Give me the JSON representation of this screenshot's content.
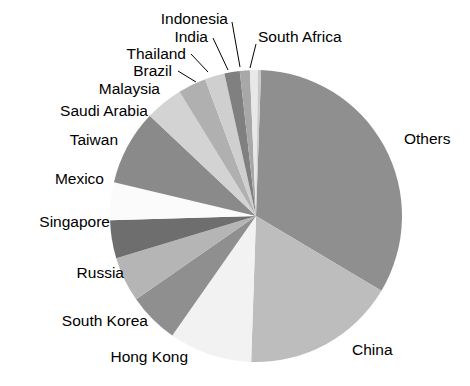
{
  "chart_data": {
    "type": "pie",
    "title": "",
    "subtitle": "",
    "xlabel": "",
    "ylabel": "",
    "legend_position": "none",
    "grid": false,
    "labels_outside": true,
    "categories": [
      "Others",
      "China",
      "Hong Kong",
      "South Korea",
      "Russia",
      "Singapore",
      "Mexico",
      "Taiwan",
      "Saudi Arabia",
      "Malaysia",
      "Brazil",
      "Thailand",
      "India",
      "Indonesia",
      "South Africa"
    ],
    "values": [
      33.0,
      17.0,
      9.2,
      5.6,
      5.0,
      4.2,
      4.2,
      8.3,
      4.2,
      3.1,
      2.2,
      1.7,
      1.1,
      0.9,
      0.3
    ],
    "units": "percent",
    "slices": [
      {
        "label": "Others",
        "value": 33.0,
        "color": "#8f8f8f",
        "start_deg": -88.0,
        "end_deg": 30.8
      },
      {
        "label": "China",
        "value": 17.0,
        "color": "#bdbdbd",
        "start_deg": 30.8,
        "end_deg": 91.9
      },
      {
        "label": "Hong Kong",
        "value": 9.2,
        "color": "#f2f2f2",
        "start_deg": 91.9,
        "end_deg": 125.0
      },
      {
        "label": "South Korea",
        "value": 5.6,
        "color": "#8f8f8f",
        "start_deg": 125.0,
        "end_deg": 145.2
      },
      {
        "label": "Russia",
        "value": 5.0,
        "color": "#b5b5b5",
        "start_deg": 145.2,
        "end_deg": 163.2
      },
      {
        "label": "Singapore",
        "value": 4.2,
        "color": "#6e6e6e",
        "start_deg": 163.2,
        "end_deg": 178.3
      },
      {
        "label": "Mexico",
        "value": 4.2,
        "color": "#fbfbfb",
        "start_deg": 178.3,
        "end_deg": 193.4
      },
      {
        "label": "Taiwan",
        "value": 8.3,
        "color": "#8a8a8a",
        "start_deg": 193.4,
        "end_deg": 223.3
      },
      {
        "label": "Saudi Arabia",
        "value": 4.2,
        "color": "#d3d3d3",
        "start_deg": 223.3,
        "end_deg": 238.4
      },
      {
        "label": "Malaysia",
        "value": 3.1,
        "color": "#b0b0b0",
        "start_deg": 238.4,
        "end_deg": 249.6
      },
      {
        "label": "Brazil",
        "value": 2.2,
        "color": "#cfcfcf",
        "start_deg": 249.6,
        "end_deg": 257.5
      },
      {
        "label": "Thailand",
        "value": 1.7,
        "color": "#808080",
        "start_deg": 257.5,
        "end_deg": 263.6
      },
      {
        "label": "India",
        "value": 1.1,
        "color": "#a8a8a8",
        "start_deg": 263.6,
        "end_deg": 267.6
      },
      {
        "label": "Indonesia",
        "value": 0.9,
        "color": "#e8e8e8",
        "start_deg": 267.6,
        "end_deg": 270.8
      },
      {
        "label": "South Africa",
        "value": 0.3,
        "color": "#c9c9c9",
        "start_deg": 270.8,
        "end_deg": 272.0
      }
    ],
    "geometry": {
      "center_x": 256,
      "center_y": 216,
      "radius": 146
    },
    "annotations": [
      {
        "name": "others",
        "text": "Others",
        "x": 404,
        "y": 140,
        "anchor": "start",
        "leader": null
      },
      {
        "name": "china",
        "text": "China",
        "x": 352,
        "y": 351,
        "anchor": "start",
        "leader": null
      },
      {
        "name": "hong-kong",
        "text": "Hong Kong",
        "x": 188,
        "y": 358,
        "anchor": "end",
        "leader": null
      },
      {
        "name": "south-korea",
        "text": "South Korea",
        "x": 148,
        "y": 322,
        "anchor": "end",
        "leader": null
      },
      {
        "name": "russia",
        "text": "Russia",
        "x": 124,
        "y": 274,
        "anchor": "end",
        "leader": null
      },
      {
        "name": "singapore",
        "text": "Singapore",
        "x": 110,
        "y": 223,
        "anchor": "end",
        "leader": null
      },
      {
        "name": "mexico",
        "text": "Mexico",
        "x": 104,
        "y": 180,
        "anchor": "end",
        "leader": null
      },
      {
        "name": "taiwan",
        "text": "Taiwan",
        "x": 118,
        "y": 141,
        "anchor": "end",
        "leader": null
      },
      {
        "name": "saudi-arabia",
        "text": "Saudi Arabia",
        "x": 148,
        "y": 112,
        "anchor": "end",
        "leader": null
      },
      {
        "name": "malaysia",
        "text": "Malaysia",
        "x": 160,
        "y": 90,
        "anchor": "end",
        "leader": null
      },
      {
        "name": "brazil",
        "text": "Brazil",
        "x": 172,
        "y": 72,
        "anchor": "end",
        "leader": {
          "x1": 178,
          "y1": 71,
          "x2": 196,
          "y2": 82
        }
      },
      {
        "name": "thailand",
        "text": "Thailand",
        "x": 186,
        "y": 55,
        "anchor": "end",
        "leader": {
          "x1": 191,
          "y1": 54,
          "x2": 208,
          "y2": 72
        }
      },
      {
        "name": "india",
        "text": "India",
        "x": 208,
        "y": 38,
        "anchor": "end",
        "leader": {
          "x1": 213,
          "y1": 38,
          "x2": 228,
          "y2": 70
        }
      },
      {
        "name": "indonesia",
        "text": "Indonesia",
        "x": 228,
        "y": 20,
        "anchor": "end",
        "leader": {
          "x1": 232,
          "y1": 22,
          "x2": 240,
          "y2": 67
        }
      },
      {
        "name": "south-africa",
        "text": "South Africa",
        "x": 258,
        "y": 38,
        "anchor": "start",
        "leader": {
          "x1": 256,
          "y1": 44,
          "x2": 250,
          "y2": 68
        }
      }
    ]
  }
}
